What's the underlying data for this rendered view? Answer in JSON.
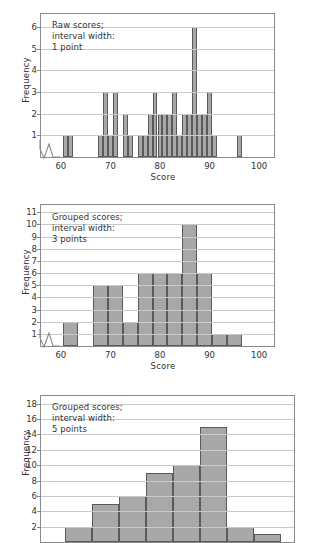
{
  "figure": {
    "title": "",
    "panels": [
      {
        "id": "raw-1-point",
        "note": "Raw scores;\ninterval width:\n1 point",
        "ylabel": "Frequency",
        "xlabel": "Score",
        "yticks": [
          "1",
          "2",
          "3",
          "4",
          "5",
          "6"
        ],
        "xticks": [
          "60",
          "70",
          "80",
          "90",
          "100"
        ]
      },
      {
        "id": "grouped-3-points",
        "note": "Grouped scores;\ninterval width:\n3 points",
        "ylabel": "Frequency",
        "xlabel": "Score",
        "yticks": [
          "1",
          "2",
          "3",
          "4",
          "5",
          "6",
          "7",
          "8",
          "9",
          "10",
          "11"
        ],
        "xticks": [
          "60",
          "70",
          "80",
          "90",
          "100"
        ]
      },
      {
        "id": "grouped-5-points",
        "note": "Grouped scores;\ninterval width:\n5 points",
        "ylabel": "Frequency",
        "xlabel": "Score",
        "yticks": [
          "2",
          "4",
          "6",
          "8",
          "10",
          "12",
          "14",
          "16",
          "18"
        ],
        "xticks": []
      }
    ],
    "colors": {
      "bar_fill": "#a8a8a8",
      "bar_edge": "#5a5a5a",
      "grid": "#c9c9c9",
      "frame": "#8a8a8a",
      "text": "#333333"
    }
  },
  "chart_data": [
    {
      "type": "bar",
      "title": "Raw scores; interval width: 1 point",
      "xlabel": "Score",
      "ylabel": "Frequency",
      "xlim": [
        56,
        103
      ],
      "ylim": [
        0,
        6.6
      ],
      "grid": true,
      "legend": "none",
      "annotation": "Raw scores; interval width: 1 point",
      "bin_width": 1,
      "categories": [
        61,
        62,
        68,
        69,
        70,
        71,
        73,
        74,
        76,
        77,
        78,
        79,
        80,
        81,
        82,
        83,
        84,
        85,
        86,
        87,
        88,
        89,
        90,
        91,
        96
      ],
      "values": [
        1,
        1,
        1,
        3,
        1,
        3,
        2,
        1,
        1,
        1,
        2,
        3,
        2,
        2,
        2,
        3,
        1,
        2,
        2,
        6,
        2,
        2,
        3,
        1,
        1
      ]
    },
    {
      "type": "bar",
      "title": "Grouped scores; interval width: 3 points",
      "xlabel": "Score",
      "ylabel": "Frequency",
      "xlim": [
        56,
        103
      ],
      "ylim": [
        0,
        11.6
      ],
      "grid": true,
      "legend": "none",
      "annotation": "Grouped scores; interval width: 3 points",
      "bin_width": 3,
      "bin_starts": [
        61,
        67,
        70,
        73,
        76,
        79,
        82,
        85,
        88,
        91,
        94
      ],
      "categories": [
        "61-63",
        "67-69",
        "70-72",
        "73-75",
        "76-78",
        "79-81",
        "82-84",
        "85-87",
        "88-90",
        "91-93",
        "94-96"
      ],
      "values": [
        2,
        5,
        5,
        2,
        6,
        6,
        6,
        10,
        6,
        1,
        1
      ]
    },
    {
      "type": "bar",
      "title": "Grouped scores; interval width: 5 points",
      "xlabel": "Score",
      "ylabel": "Frequency",
      "xlim": [
        56,
        103
      ],
      "ylim": [
        0,
        19
      ],
      "grid": true,
      "legend": "none",
      "annotation": "Grouped scores; interval width: 5 points",
      "bin_width": 5,
      "bin_starts": [
        61,
        66,
        71,
        76,
        81,
        86,
        91,
        96
      ],
      "categories": [
        "61-65",
        "66-70",
        "71-75",
        "76-80",
        "81-85",
        "86-90",
        "91-95",
        "96-100"
      ],
      "values": [
        2,
        5,
        6,
        9,
        10,
        15,
        2,
        1
      ]
    }
  ]
}
